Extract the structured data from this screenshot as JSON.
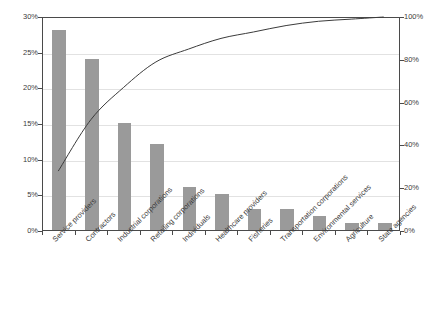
{
  "chart_data": {
    "type": "bar",
    "title": "",
    "subtitle": "",
    "xlabel": "",
    "ylabel": "",
    "categories": [
      "Service providers",
      "Contractors",
      "Industrial corporations",
      "Retailing corporations",
      "Individuals",
      "Healthcare providers",
      "Fisheries",
      "Transportation corporations",
      "Environmental services",
      "Agriculture",
      "State agencies"
    ],
    "values": [
      28,
      24,
      15,
      12,
      6,
      5,
      3,
      3,
      2,
      1,
      1
    ],
    "cumulative": [
      28,
      52,
      67,
      79,
      85,
      90,
      93,
      96,
      98,
      99,
      100
    ],
    "ylim": [
      0,
      30
    ],
    "ylim_right": [
      0,
      100
    ],
    "yticks": [
      "0%",
      "5%",
      "10%",
      "15%",
      "20%",
      "25%",
      "30%"
    ],
    "ytick_values": [
      0,
      5,
      10,
      15,
      20,
      25,
      30
    ],
    "yticks_right": [
      "0%",
      "20%",
      "40%",
      "60%",
      "80%",
      "100%"
    ],
    "ytick_values_right": [
      0,
      20,
      40,
      60,
      80,
      100
    ],
    "grid": true,
    "legend": false,
    "legend_position": "none",
    "series": [
      {
        "name": "Share",
        "type": "bar",
        "values": [
          28,
          24,
          15,
          12,
          6,
          5,
          3,
          3,
          2,
          1,
          1
        ],
        "axis": "left",
        "color": "#9a9a9a"
      },
      {
        "name": "Cumulative",
        "type": "line",
        "values": [
          28,
          52,
          67,
          79,
          85,
          90,
          93,
          96,
          98,
          99,
          100
        ],
        "axis": "right",
        "color": "#3b3b3b"
      }
    ]
  },
  "colors": {
    "bar": "#9a9a9a",
    "line": "#3b3b3b",
    "axis": "#4a4a4a",
    "grid": "#e2e2e2",
    "text": "#3b3b3b",
    "background": "#ffffff"
  }
}
